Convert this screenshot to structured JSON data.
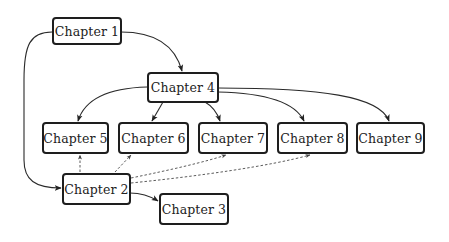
{
  "diagram": {
    "type": "dependency-graph",
    "nodes": [
      {
        "id": "ch1",
        "label": "Chapter 1"
      },
      {
        "id": "ch2",
        "label": "Chapter 2"
      },
      {
        "id": "ch3",
        "label": "Chapter 3"
      },
      {
        "id": "ch4",
        "label": "Chapter 4"
      },
      {
        "id": "ch5",
        "label": "Chapter 5"
      },
      {
        "id": "ch6",
        "label": "Chapter 6"
      },
      {
        "id": "ch7",
        "label": "Chapter 7"
      },
      {
        "id": "ch8",
        "label": "Chapter 8"
      },
      {
        "id": "ch9",
        "label": "Chapter 9"
      }
    ],
    "edges": [
      {
        "from": "ch1",
        "to": "ch4",
        "style": "solid"
      },
      {
        "from": "ch1",
        "to": "ch2",
        "style": "solid"
      },
      {
        "from": "ch4",
        "to": "ch5",
        "style": "solid"
      },
      {
        "from": "ch4",
        "to": "ch6",
        "style": "solid"
      },
      {
        "from": "ch4",
        "to": "ch7",
        "style": "solid"
      },
      {
        "from": "ch4",
        "to": "ch8",
        "style": "solid"
      },
      {
        "from": "ch4",
        "to": "ch9",
        "style": "solid"
      },
      {
        "from": "ch2",
        "to": "ch3",
        "style": "solid"
      },
      {
        "from": "ch2",
        "to": "ch5",
        "style": "dashed"
      },
      {
        "from": "ch2",
        "to": "ch6",
        "style": "dashed"
      },
      {
        "from": "ch2",
        "to": "ch7",
        "style": "dashed"
      },
      {
        "from": "ch2",
        "to": "ch8",
        "style": "dashed"
      }
    ],
    "colors": {
      "node_border": "#1e1e1e",
      "edge": "#2a2a2a",
      "background": "#ffffff"
    }
  }
}
